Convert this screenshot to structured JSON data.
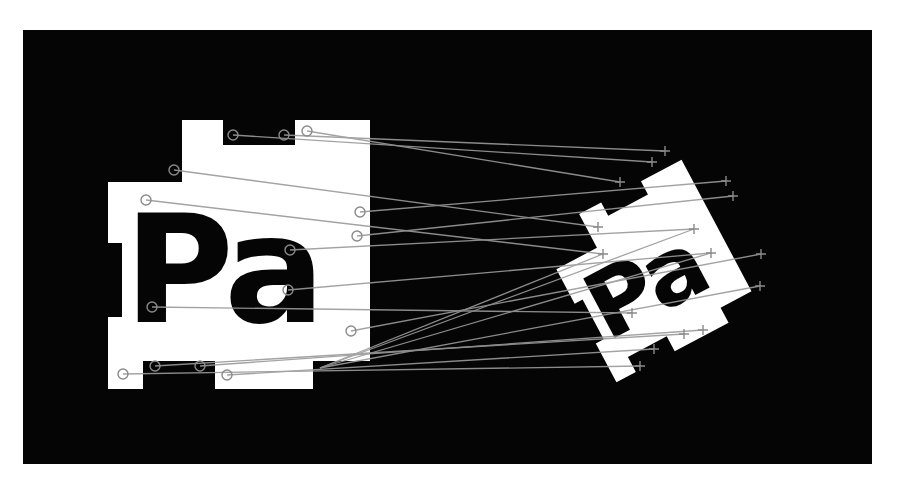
{
  "figure": {
    "background": "#ffffff",
    "frame": {
      "x": 23,
      "y": 30,
      "width": 849,
      "height": 434,
      "color": "#050505"
    },
    "marker_color": "#ffffff",
    "ink_color": "#050505",
    "match_line_color": "#9a9a9a",
    "keypoint_color": "#8a8a8a"
  },
  "left_shape": {
    "label": "Pa",
    "polygon": "182,120 223,120 223,145 295,145 295,120 370,120 370,361 313,361 313,389 215,389 215,361 143,361 143,389 108,389 108,317 122,317 122,243 108,243 108,182 182,182",
    "keypoints": [
      {
        "x": 233,
        "y": 135
      },
      {
        "x": 284,
        "y": 135
      },
      {
        "x": 307,
        "y": 131
      },
      {
        "x": 174,
        "y": 170
      },
      {
        "x": 146,
        "y": 200
      },
      {
        "x": 360,
        "y": 212
      },
      {
        "x": 357,
        "y": 236
      },
      {
        "x": 290,
        "y": 250
      },
      {
        "x": 288,
        "y": 290
      },
      {
        "x": 152,
        "y": 307
      },
      {
        "x": 351,
        "y": 331
      },
      {
        "x": 155,
        "y": 366
      },
      {
        "x": 200,
        "y": 366
      },
      {
        "x": 123,
        "y": 374
      },
      {
        "x": 227,
        "y": 375
      }
    ]
  },
  "right_shape": {
    "label": "Pa",
    "rotation_deg": -28,
    "center": {
      "x": 668,
      "y": 262
    },
    "keypoints": [
      {
        "x": 665,
        "y": 151
      },
      {
        "x": 652,
        "y": 162
      },
      {
        "x": 620,
        "y": 182
      },
      {
        "x": 726,
        "y": 181
      },
      {
        "x": 733,
        "y": 196
      },
      {
        "x": 598,
        "y": 227
      },
      {
        "x": 694,
        "y": 229
      },
      {
        "x": 603,
        "y": 254
      },
      {
        "x": 711,
        "y": 253
      },
      {
        "x": 761,
        "y": 254
      },
      {
        "x": 760,
        "y": 286
      },
      {
        "x": 632,
        "y": 313
      },
      {
        "x": 684,
        "y": 334
      },
      {
        "x": 703,
        "y": 330
      },
      {
        "x": 654,
        "y": 349
      },
      {
        "x": 640,
        "y": 366
      }
    ]
  },
  "matches": [
    {
      "from": [
        233,
        135
      ],
      "to": [
        652,
        162
      ]
    },
    {
      "from": [
        284,
        135
      ],
      "to": [
        665,
        151
      ]
    },
    {
      "from": [
        307,
        131
      ],
      "to": [
        620,
        182
      ]
    },
    {
      "from": [
        174,
        170
      ],
      "to": [
        598,
        227
      ]
    },
    {
      "from": [
        146,
        200
      ],
      "to": [
        603,
        254
      ]
    },
    {
      "from": [
        360,
        212
      ],
      "to": [
        726,
        181
      ]
    },
    {
      "from": [
        357,
        236
      ],
      "to": [
        733,
        196
      ]
    },
    {
      "from": [
        290,
        250
      ],
      "to": [
        694,
        229
      ]
    },
    {
      "from": [
        288,
        290
      ],
      "to": [
        711,
        253
      ]
    },
    {
      "from": [
        152,
        307
      ],
      "to": [
        632,
        313
      ]
    },
    {
      "from": [
        351,
        331
      ],
      "to": [
        761,
        254
      ]
    },
    {
      "from": [
        155,
        366
      ],
      "to": [
        684,
        334
      ]
    },
    {
      "from": [
        200,
        366
      ],
      "to": [
        703,
        330
      ]
    },
    {
      "from": [
        123,
        374
      ],
      "to": [
        640,
        366
      ]
    },
    {
      "from": [
        227,
        375
      ],
      "to": [
        654,
        349
      ]
    },
    {
      "from": [
        320,
        368
      ],
      "to": [
        760,
        286
      ]
    },
    {
      "from": [
        320,
        368
      ],
      "to": [
        711,
        253
      ]
    },
    {
      "from": [
        320,
        368
      ],
      "to": [
        694,
        229
      ]
    },
    {
      "from": [
        320,
        368
      ],
      "to": [
        603,
        254
      ]
    }
  ]
}
